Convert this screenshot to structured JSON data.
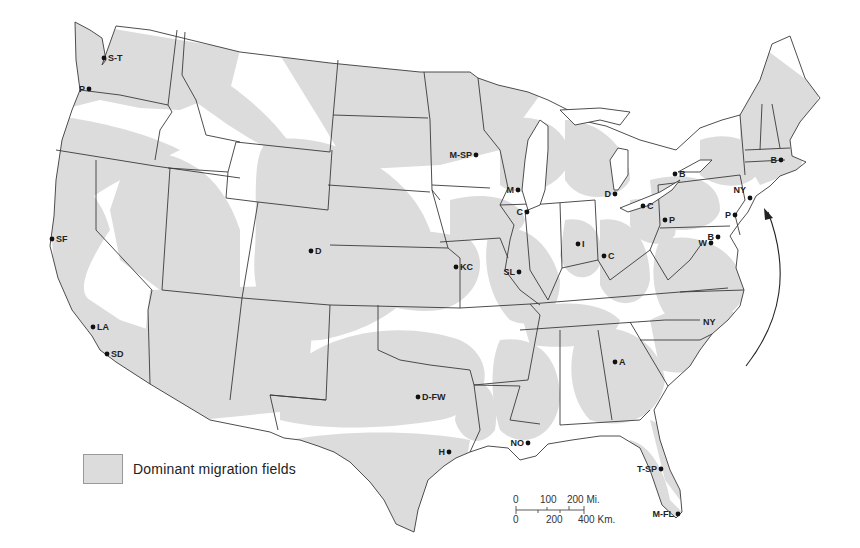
{
  "map": {
    "type": "thematic map",
    "subject": "United States",
    "shading_color": "#dcdcdc",
    "border_color": "#3a3a3a"
  },
  "legend": {
    "label": "Dominant migration fields",
    "swatch_color": "#dcdcdc"
  },
  "cities": [
    {
      "id": "seattle-tacoma",
      "label": "S-T",
      "x": 104,
      "y": 58
    },
    {
      "id": "portland",
      "label": "P",
      "x": 89,
      "y": 89
    },
    {
      "id": "san-francisco",
      "label": "SF",
      "x": 52,
      "y": 239
    },
    {
      "id": "los-angeles",
      "label": "LA",
      "x": 93,
      "y": 327
    },
    {
      "id": "san-diego",
      "label": "SD",
      "x": 107,
      "y": 354
    },
    {
      "id": "denver",
      "label": "D",
      "x": 311,
      "y": 251
    },
    {
      "id": "minneapolis-st-paul",
      "label": "M-SP",
      "x": 476,
      "y": 155
    },
    {
      "id": "milwaukee",
      "label": "M",
      "x": 518,
      "y": 190
    },
    {
      "id": "chicago",
      "label": "C",
      "x": 527,
      "y": 212
    },
    {
      "id": "detroit",
      "label": "D",
      "x": 615,
      "y": 194
    },
    {
      "id": "cleveland",
      "label": "C",
      "x": 643,
      "y": 206
    },
    {
      "id": "buffalo",
      "label": "B",
      "x": 675,
      "y": 174
    },
    {
      "id": "pittsburgh",
      "label": "P",
      "x": 665,
      "y": 220
    },
    {
      "id": "indianapolis",
      "label": "I",
      "x": 578,
      "y": 244
    },
    {
      "id": "cincinnati",
      "label": "C",
      "x": 604,
      "y": 256
    },
    {
      "id": "kansas-city",
      "label": "KC",
      "x": 456,
      "y": 267
    },
    {
      "id": "st-louis",
      "label": "SL",
      "x": 519,
      "y": 272
    },
    {
      "id": "new-york",
      "label": "NY",
      "x": 750,
      "y": 198
    },
    {
      "id": "philadelphia",
      "label": "P",
      "x": 735,
      "y": 215
    },
    {
      "id": "baltimore",
      "label": "B",
      "x": 718,
      "y": 237
    },
    {
      "id": "washington",
      "label": "W",
      "x": 711,
      "y": 243
    },
    {
      "id": "boston",
      "label": "B",
      "x": 781,
      "y": 160
    },
    {
      "id": "atlanta",
      "label": "A",
      "x": 615,
      "y": 362
    },
    {
      "id": "dallas-fort-worth",
      "label": "D-FW",
      "x": 418,
      "y": 397
    },
    {
      "id": "houston",
      "label": "H",
      "x": 449,
      "y": 452
    },
    {
      "id": "new-orleans",
      "label": "NO",
      "x": 528,
      "y": 443
    },
    {
      "id": "tampa-st-petersburg",
      "label": "T-SP",
      "x": 661,
      "y": 469
    },
    {
      "id": "miami-fort-lauderdale",
      "label": "M-FL",
      "x": 678,
      "y": 514
    }
  ],
  "annotations": [
    {
      "id": "nc-label",
      "label": "NY",
      "x": 703,
      "y": 322
    }
  ],
  "scale_bar": {
    "miles_ticks": [
      "0",
      "100",
      "200 Mi."
    ],
    "km_ticks": [
      "0",
      "200",
      "400 Km."
    ]
  }
}
